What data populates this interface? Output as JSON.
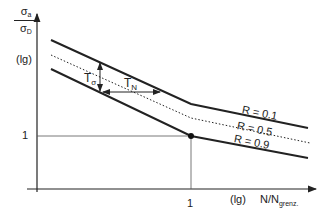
{
  "diagram": {
    "y_axis": {
      "label_numerator": "σ",
      "label_numerator_sub": "a",
      "label_denominator": "σ",
      "label_denominator_sub": "D",
      "scale": "(lg)",
      "tick": "1"
    },
    "x_axis": {
      "scale": "(lg)",
      "label": "N/N",
      "label_sub": "grenz.",
      "tick": "1"
    },
    "annotations": {
      "t_sigma": "T",
      "t_sigma_sub": "σ",
      "t_n": "T",
      "t_n_sub": "N"
    },
    "curves": [
      {
        "name": "R = 0.1",
        "style": "solid"
      },
      {
        "name": "R = 0.5",
        "style": "dotted"
      },
      {
        "name": "R = 0.9",
        "style": "solid"
      }
    ],
    "colors": {
      "line": "#222222",
      "grid": "#555555"
    }
  }
}
